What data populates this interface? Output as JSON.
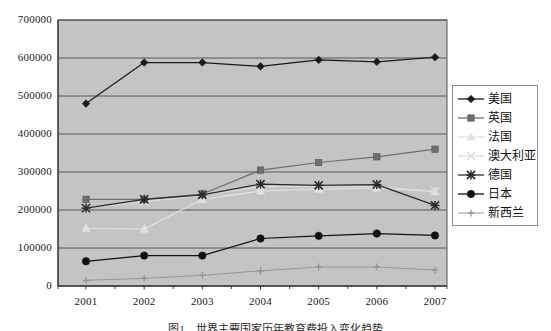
{
  "chart_data": {
    "type": "line",
    "title": "",
    "xlabel": "",
    "ylabel": "",
    "categories": [
      "2001",
      "2002",
      "2003",
      "2004",
      "2005",
      "2006",
      "2007"
    ],
    "ylim": [
      0,
      700000
    ],
    "ytick_step": 100000,
    "yticks": [
      "0",
      "100000",
      "200000",
      "300000",
      "400000",
      "500000",
      "600000",
      "700000"
    ],
    "grid": true,
    "legend_position": "right",
    "plot_background": "#c4c4c4",
    "series": [
      {
        "name": "美国",
        "marker": "diamond",
        "color": "#1a1a1a",
        "values": [
          480000,
          588000,
          588000,
          578000,
          595000,
          590000,
          602000
        ]
      },
      {
        "name": "英国",
        "marker": "square",
        "color": "#6e6e6e",
        "values": [
          228000,
          228000,
          242000,
          305000,
          325000,
          340000,
          360000
        ]
      },
      {
        "name": "法国",
        "marker": "triangle",
        "color": "#e2e2e2",
        "values": [
          152000,
          150000,
          228000,
          250000,
          255000,
          258000,
          248000
        ]
      },
      {
        "name": "澳大利亚",
        "marker": "cross-x",
        "color": "#dcdcdc",
        "values": [
          205000,
          222000,
          238000,
          262000,
          262000,
          262000,
          250000
        ]
      },
      {
        "name": "德国",
        "marker": "asterisk",
        "color": "#2a2a2a",
        "values": [
          205000,
          228000,
          240000,
          268000,
          265000,
          267000,
          212000
        ]
      },
      {
        "name": "日本",
        "marker": "circle",
        "color": "#111111",
        "values": [
          65000,
          80000,
          80000,
          125000,
          132000,
          138000,
          133000
        ]
      },
      {
        "name": "新西兰",
        "marker": "plus",
        "color": "#909090",
        "values": [
          15000,
          20000,
          28000,
          40000,
          50000,
          50000,
          42000
        ]
      }
    ]
  },
  "caption": {
    "text": "图1　世界主要国家历年教育费投入变化趋势"
  }
}
